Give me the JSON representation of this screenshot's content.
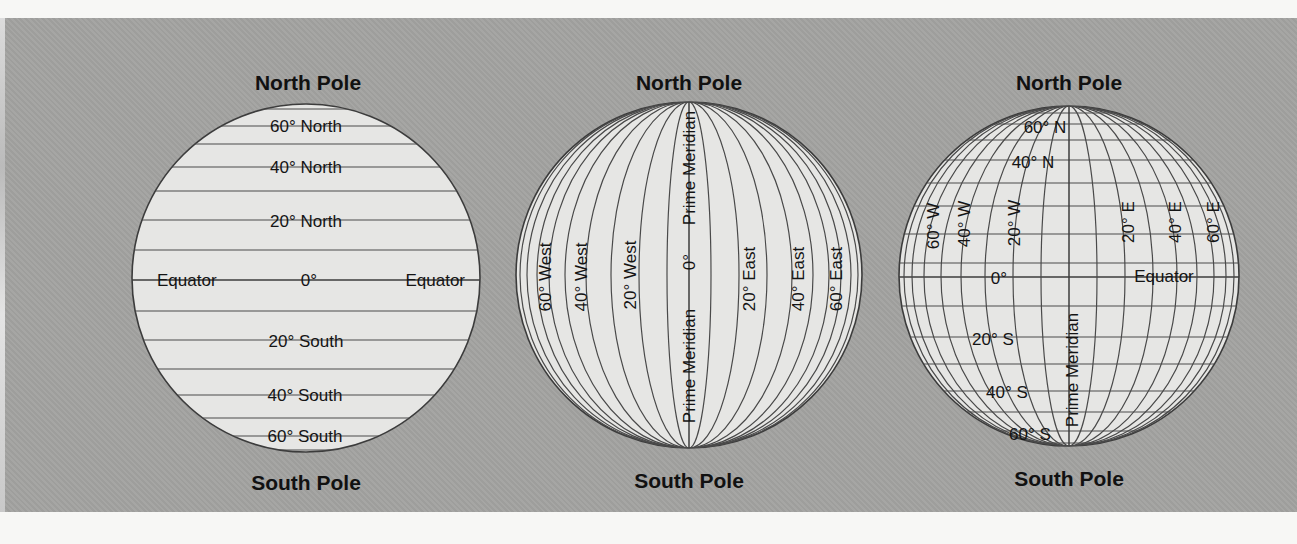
{
  "figure": {
    "background_color": "#a3a3a1",
    "globe_color": "#e6e6e4",
    "line_color": "#3c3c3c"
  },
  "globes": [
    {
      "id": "latitude",
      "north_label": "North Pole",
      "south_label": "South Pole",
      "labels": {
        "lat_60n": "60° North",
        "lat_40n": "40° North",
        "lat_20n": "20° North",
        "equator_left": "Equator",
        "zero": "0°",
        "equator_right": "Equator",
        "lat_20s": "20° South",
        "lat_40s": "40° South",
        "lat_60s": "60° South"
      }
    },
    {
      "id": "longitude",
      "north_label": "North Pole",
      "south_label": "South Pole",
      "labels": {
        "lon_60w": "60° West",
        "lon_40w": "40° West",
        "lon_20w": "20° West",
        "prime_meridian_top": "Prime Meridian",
        "zero": "0°",
        "prime_meridian_bottom": "Prime Meridian",
        "lon_20e": "20° East",
        "lon_40e": "40° East",
        "lon_60e": "60° East"
      }
    },
    {
      "id": "grid",
      "north_label": "North Pole",
      "south_label": "South Pole",
      "labels": {
        "lat_60n": "60° N",
        "lat_40n": "40° N",
        "lon_60w": "60° W",
        "lon_40w": "40° W",
        "lon_20w": "20° W",
        "lon_20e": "20° E",
        "lon_40e": "40° E",
        "lon_60e": "60° E",
        "zero": "0°",
        "equator": "Equator",
        "lat_20s": "20° S",
        "lat_40s": "40° S",
        "lat_60s": "60° S",
        "prime_meridian": "Prime Meridian"
      }
    }
  ]
}
